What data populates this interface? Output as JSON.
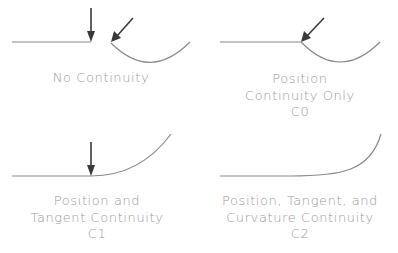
{
  "diagram": {
    "colors": {
      "curve": "#8a8a8a",
      "arrow": "#3a3a3a",
      "text": "#9a9a9a",
      "background": "#ffffff"
    },
    "panels": [
      {
        "id": "no-continuity",
        "label_lines": [
          "No Continuity"
        ],
        "arrows": 2,
        "description": "Two separate curves with a gap between endpoints"
      },
      {
        "id": "c0",
        "label_lines": [
          "Position",
          "Continuity Only",
          "C0"
        ],
        "arrows": 1,
        "description": "Curves meet at a point with a sharp corner"
      },
      {
        "id": "c1",
        "label_lines": [
          "Position and",
          "Tangent Continuity",
          "C1"
        ],
        "arrows": 1,
        "description": "Curves meet with matching tangent direction"
      },
      {
        "id": "c2",
        "label_lines": [
          "Position, Tangent, and",
          "Curvature Continuity",
          "C2"
        ],
        "arrows": 0,
        "description": "Curves blend smoothly with matching curvature"
      }
    ]
  }
}
